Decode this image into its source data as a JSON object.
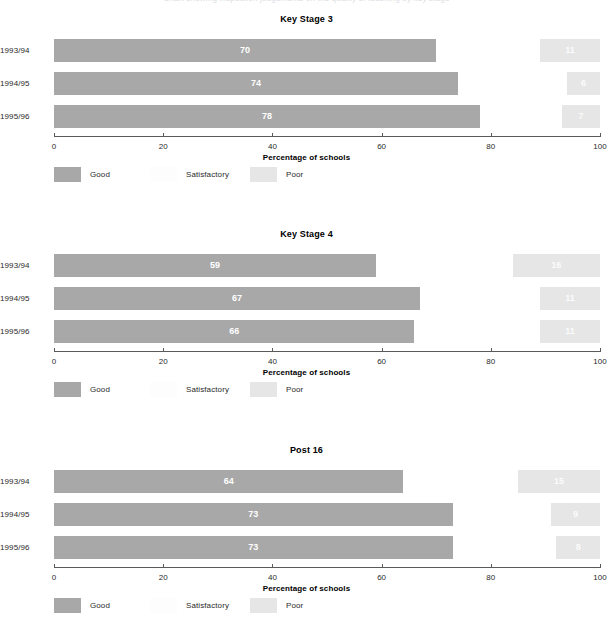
{
  "top_clip_text": "Chart showing inspection judgements on the quality of teaching by key stage",
  "axis": {
    "title": "Percentage of schools",
    "ticks": [
      0,
      20,
      40,
      60,
      80,
      100
    ],
    "tick_labels": [
      "0",
      "20",
      "40",
      "60",
      "80",
      "100"
    ],
    "min": 0,
    "max": 100
  },
  "legend": {
    "items": [
      {
        "label": "Good",
        "color": "#a8a8a8",
        "key": "good"
      },
      {
        "label": "Satisfactory",
        "color": "#fdfdfd",
        "key": "satisfactory"
      },
      {
        "label": "Poor",
        "color": "#e6e6e6",
        "key": "poor"
      }
    ]
  },
  "colors": {
    "good": "#a8a8a8",
    "satisfactory": "#fdfdfd",
    "poor": "#e6e6e6",
    "axis": "#5a5a5a",
    "text": "#2a2a2a",
    "value_text": "#ffffff"
  },
  "charts": [
    {
      "title": "Key Stage 3",
      "rows": [
        {
          "year": "1993/94",
          "good": 70,
          "poor": 11
        },
        {
          "year": "1994/95",
          "good": 74,
          "poor": 6
        },
        {
          "year": "1995/96",
          "good": 78,
          "poor": 7
        }
      ]
    },
    {
      "title": "Key Stage 4",
      "rows": [
        {
          "year": "1993/94",
          "good": 59,
          "poor": 16
        },
        {
          "year": "1994/95",
          "good": 67,
          "poor": 11
        },
        {
          "year": "1995/96",
          "good": 66,
          "poor": 11
        }
      ]
    },
    {
      "title": "Post 16",
      "rows": [
        {
          "year": "1993/94",
          "good": 64,
          "poor": 15
        },
        {
          "year": "1994/95",
          "good": 73,
          "poor": 9
        },
        {
          "year": "1995/96",
          "good": 73,
          "poor": 8
        }
      ]
    }
  ],
  "chart_data": [
    {
      "type": "bar",
      "orientation": "horizontal",
      "title": "Key Stage 3",
      "xlabel": "Percentage of schools",
      "ylabel": "",
      "xlim": [
        0,
        100
      ],
      "grid": false,
      "legend_position": "bottom-left",
      "categories": [
        "1993/94",
        "1994/95",
        "1995/96"
      ],
      "series": [
        {
          "name": "Good",
          "values": [
            70,
            74,
            78
          ]
        },
        {
          "name": "Satisfactory",
          "values": [
            19,
            20,
            15
          ]
        },
        {
          "name": "Poor",
          "values": [
            11,
            6,
            7
          ]
        }
      ]
    },
    {
      "type": "bar",
      "orientation": "horizontal",
      "title": "Key Stage 4",
      "xlabel": "Percentage of schools",
      "ylabel": "",
      "xlim": [
        0,
        100
      ],
      "grid": false,
      "legend_position": "bottom-left",
      "categories": [
        "1993/94",
        "1994/95",
        "1995/96"
      ],
      "series": [
        {
          "name": "Good",
          "values": [
            59,
            67,
            66
          ]
        },
        {
          "name": "Satisfactory",
          "values": [
            25,
            22,
            23
          ]
        },
        {
          "name": "Poor",
          "values": [
            16,
            11,
            11
          ]
        }
      ]
    },
    {
      "type": "bar",
      "orientation": "horizontal",
      "title": "Post 16",
      "xlabel": "Percentage of schools",
      "ylabel": "",
      "xlim": [
        0,
        100
      ],
      "grid": false,
      "legend_position": "bottom-left",
      "categories": [
        "1993/94",
        "1994/95",
        "1995/96"
      ],
      "series": [
        {
          "name": "Good",
          "values": [
            64,
            73,
            73
          ]
        },
        {
          "name": "Satisfactory",
          "values": [
            21,
            18,
            19
          ]
        },
        {
          "name": "Poor",
          "values": [
            15,
            9,
            8
          ]
        }
      ]
    }
  ]
}
